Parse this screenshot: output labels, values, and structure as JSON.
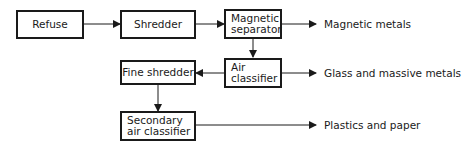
{
  "diagram": {
    "nodes": {
      "refuse": "Refuse",
      "shredder": "Shredder",
      "magnetic_separator": [
        "Magnetic",
        "separator"
      ],
      "air_classifier": [
        "Air",
        "classifier"
      ],
      "fine_shredder": "Fine shredder",
      "secondary_air_classifier": [
        "Secondary",
        "air classifier"
      ]
    },
    "outputs": {
      "magnetic_metals": "Magnetic metals",
      "glass_metals": "Glass and massive metals",
      "plastics_paper": "Plastics and paper"
    },
    "edges": [
      {
        "from": "Refuse",
        "to": "Shredder"
      },
      {
        "from": "Shredder",
        "to": "Magnetic separator"
      },
      {
        "from": "Magnetic separator",
        "to": "Magnetic metals"
      },
      {
        "from": "Magnetic separator",
        "to": "Air classifier"
      },
      {
        "from": "Air classifier",
        "to": "Glass and massive metals"
      },
      {
        "from": "Air classifier",
        "to": "Fine shredder"
      },
      {
        "from": "Fine shredder",
        "to": "Secondary air classifier"
      },
      {
        "from": "Secondary air classifier",
        "to": "Plastics and paper"
      }
    ]
  }
}
